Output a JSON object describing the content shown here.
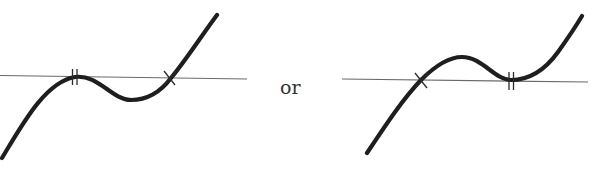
{
  "diagram": {
    "separator_text": "or",
    "figures": [
      {
        "id": "left",
        "description": "Cubic curve rising from lower-left, tangent to axis (double root) then dipping to a local minimum and crossing axis (single root), rising to upper-right",
        "roots": [
          {
            "type": "double",
            "mark": "double-tick",
            "x": 75
          },
          {
            "type": "single",
            "mark": "cross",
            "x": 170
          }
        ]
      },
      {
        "id": "right",
        "description": "Cubic curve rising from lower-left, crossing axis (single root), reaching local maximum, then tangent to axis (double root), rising to upper-right",
        "roots": [
          {
            "type": "single",
            "mark": "cross",
            "x": 421
          },
          {
            "type": "double",
            "mark": "double-tick",
            "x": 511
          }
        ]
      }
    ],
    "colors": {
      "curve": "#1e1e1e",
      "axis": "#6a6a6a",
      "background": "#ffffff"
    }
  }
}
